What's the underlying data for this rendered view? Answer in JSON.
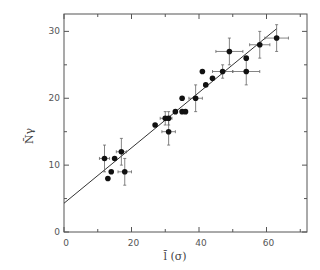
{
  "chart_data": {
    "type": "scatter",
    "title": "",
    "xlabel": "l̄ (σ)",
    "ylabel": "N̄γ",
    "xlim": [
      0,
      72
    ],
    "ylim": [
      0,
      32.6
    ],
    "xticks": [
      0,
      20,
      40,
      60
    ],
    "xminor": [
      10,
      30,
      50,
      70
    ],
    "yticks": [
      0,
      10,
      20,
      30
    ],
    "yminor": [
      5,
      15,
      25
    ],
    "grid": false,
    "legend": null,
    "points": [
      {
        "x": 12,
        "y": 11,
        "xerr": 1.5,
        "yerr": 2
      },
      {
        "x": 13,
        "y": 8,
        "xerr": 0,
        "yerr": 0
      },
      {
        "x": 14,
        "y": 9,
        "xerr": 0,
        "yerr": 0
      },
      {
        "x": 15,
        "y": 11,
        "xerr": 0,
        "yerr": 0
      },
      {
        "x": 17,
        "y": 12,
        "xerr": 1.5,
        "yerr": 2
      },
      {
        "x": 18,
        "y": 9,
        "xerr": 2,
        "yerr": 2
      },
      {
        "x": 27,
        "y": 16,
        "xerr": 0,
        "yerr": 0
      },
      {
        "x": 30,
        "y": 17,
        "xerr": 1.5,
        "yerr": 1
      },
      {
        "x": 31,
        "y": 17,
        "xerr": 1,
        "yerr": 1
      },
      {
        "x": 31,
        "y": 15,
        "xerr": 2,
        "yerr": 2
      },
      {
        "x": 33,
        "y": 18,
        "xerr": 0,
        "yerr": 0
      },
      {
        "x": 35,
        "y": 18,
        "xerr": 0,
        "yerr": 0
      },
      {
        "x": 36,
        "y": 18,
        "xerr": 0,
        "yerr": 0
      },
      {
        "x": 35,
        "y": 20,
        "xerr": 0,
        "yerr": 0
      },
      {
        "x": 39,
        "y": 20,
        "xerr": 2,
        "yerr": 2
      },
      {
        "x": 41,
        "y": 24,
        "xerr": 0,
        "yerr": 0
      },
      {
        "x": 42,
        "y": 22,
        "xerr": 0,
        "yerr": 0
      },
      {
        "x": 44,
        "y": 23,
        "xerr": 0,
        "yerr": 0
      },
      {
        "x": 47,
        "y": 24,
        "xerr": 3,
        "yerr": 1
      },
      {
        "x": 49,
        "y": 27,
        "xerr": 4,
        "yerr": 2
      },
      {
        "x": 54,
        "y": 26,
        "xerr": 0,
        "yerr": 0
      },
      {
        "x": 54,
        "y": 24,
        "xerr": 4,
        "yerr": 2
      },
      {
        "x": 58,
        "y": 28,
        "xerr": 3,
        "yerr": 2
      },
      {
        "x": 63,
        "y": 29,
        "xerr": 3.5,
        "yerr": 2
      }
    ],
    "fit_line": {
      "x0": 0,
      "y0": 4.3,
      "x1": 63,
      "y1": 30.4
    }
  }
}
